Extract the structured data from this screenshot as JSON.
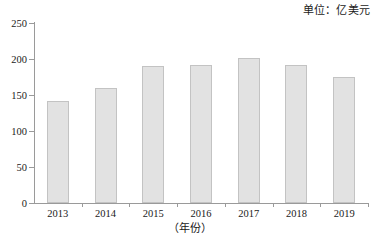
{
  "chart_data": {
    "type": "bar",
    "title": "",
    "subtitle": "",
    "unit_note": "单位：亿美元",
    "categories": [
      "2013",
      "2014",
      "2015",
      "2016",
      "2017",
      "2018",
      "2019"
    ],
    "values": [
      142,
      160,
      190,
      192,
      202,
      192,
      175
    ],
    "series": [
      {
        "name": "进出口额",
        "values": [
          142,
          160,
          190,
          192,
          202,
          192,
          175
        ]
      }
    ],
    "xlabel": "（年份）",
    "ylabel": "",
    "ylim": [
      0,
      250
    ],
    "yticks": [
      0,
      50,
      100,
      150,
      200,
      250
    ],
    "ytick_labels": [
      "0",
      "50",
      "100",
      "150",
      "200",
      "250"
    ],
    "grid": false,
    "legend": null,
    "legend_position": "none",
    "bar_color": "#e2e2e2",
    "bar_border_color": "#c3c3c3",
    "axis_color": "#9a9a9a",
    "background_color": "#ffffff",
    "text_color": "#1a1a1a"
  }
}
